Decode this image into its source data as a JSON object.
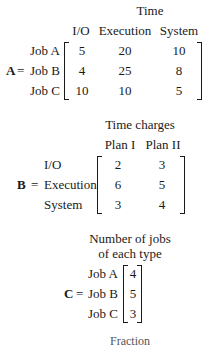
{
  "matrixA": {
    "name": "A",
    "header": "Time",
    "columns": [
      "I/O",
      "Execution",
      "System"
    ],
    "rows": [
      {
        "label": "Job A",
        "values": [
          "5",
          "20",
          "10"
        ]
      },
      {
        "label": "Job B",
        "values": [
          "4",
          "25",
          "8"
        ]
      },
      {
        "label": "Job C",
        "values": [
          "10",
          "10",
          "5"
        ]
      }
    ]
  },
  "matrixB": {
    "name": "B",
    "header": "Time charges",
    "columns": [
      "Plan I",
      "Plan II"
    ],
    "rows": [
      {
        "label": "I/O",
        "values": [
          "2",
          "3"
        ]
      },
      {
        "label": "Execution",
        "values": [
          "6",
          "5"
        ]
      },
      {
        "label": "System",
        "values": [
          "3",
          "4"
        ]
      }
    ]
  },
  "matrixC": {
    "name": "C",
    "header_line1": "Number of jobs",
    "header_line2": "of each type",
    "rows": [
      {
        "label": "Job A",
        "values": [
          "4"
        ]
      },
      {
        "label": "Job B",
        "values": [
          "5"
        ]
      },
      {
        "label": "Job C",
        "values": [
          "3"
        ]
      }
    ]
  },
  "equals": "=",
  "cutoff_heading": "Fraction"
}
